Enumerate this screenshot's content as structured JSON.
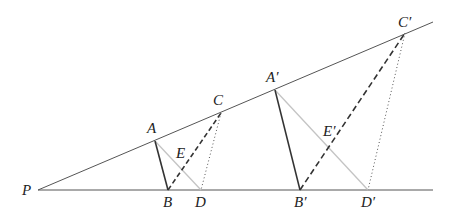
{
  "diagram": {
    "colors": {
      "ray": "#555555",
      "solid_segment": "#333333",
      "light_segment": "#c4c4c4",
      "dashed_segment": "#333333",
      "dotted_segment": "#555555",
      "label": "#222222"
    },
    "labels": {
      "P": "P",
      "A": "A",
      "B": "B",
      "C": "C",
      "D": "D",
      "E": "E",
      "A_prime": "A′",
      "B_prime": "B′",
      "C_prime": "C′",
      "D_prime": "D′",
      "E_prime": "E′"
    },
    "points": {
      "P": [
        38,
        190
      ],
      "A": [
        155,
        141
      ],
      "B": [
        168,
        190
      ],
      "C": [
        221,
        113
      ],
      "D": [
        201,
        190
      ],
      "E": [
        181,
        164
      ],
      "A_prime": [
        275,
        90
      ],
      "B_prime": [
        300,
        190
      ],
      "C_prime": [
        405,
        33
      ],
      "D_prime": [
        368,
        190
      ],
      "E_prime": [
        329,
        151
      ]
    },
    "segments": [
      {
        "from": "P",
        "to": "ray_end_upper",
        "style": "ray"
      },
      {
        "from": "P",
        "to": "ray_end_lower",
        "style": "ray"
      },
      {
        "from": "A",
        "to": "B",
        "style": "solid"
      },
      {
        "from": "A",
        "to": "D",
        "style": "light"
      },
      {
        "from": "B",
        "to": "C",
        "style": "dashed"
      },
      {
        "from": "C",
        "to": "D",
        "style": "dotted"
      },
      {
        "from": "A_prime",
        "to": "B_prime",
        "style": "solid"
      },
      {
        "from": "A_prime",
        "to": "D_prime",
        "style": "light"
      },
      {
        "from": "B_prime",
        "to": "C_prime",
        "style": "dashed"
      },
      {
        "from": "C_prime",
        "to": "D_prime",
        "style": "dotted"
      }
    ]
  }
}
